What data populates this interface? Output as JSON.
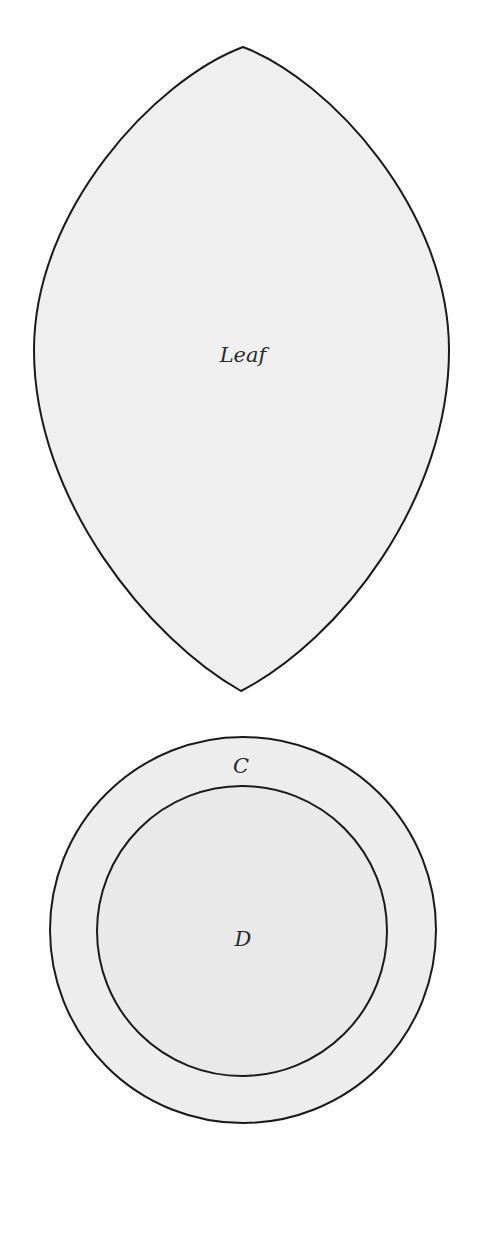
{
  "diagram": {
    "type": "venn-shapes",
    "background": "#ffffff",
    "stroke_color": "#1a1a1a",
    "shapes": [
      {
        "id": "leaf",
        "kind": "lens",
        "label": "Leaf",
        "fill": "#efefef",
        "top_tip": [
          243,
          47
        ],
        "bottom_tip": [
          241,
          691
        ],
        "left_extreme_x": 34,
        "right_extreme_x": 449,
        "label_pos": [
          243,
          362
        ]
      },
      {
        "id": "C",
        "kind": "circle",
        "label": "C",
        "fill": "#ededed",
        "cx": 243,
        "cy": 930,
        "r": 193,
        "label_pos": [
          241,
          773
        ]
      },
      {
        "id": "D",
        "kind": "circle",
        "label": "D",
        "fill": "#e9e9e9",
        "cx": 242,
        "cy": 931,
        "r": 145,
        "label_pos": [
          243,
          946
        ]
      }
    ],
    "relations": [
      "D is contained in C",
      "Leaf is disjoint from C"
    ]
  }
}
